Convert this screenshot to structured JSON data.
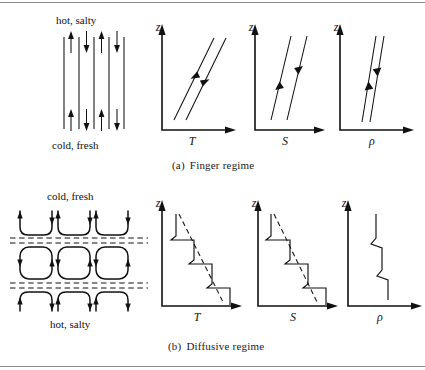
{
  "figure": {
    "title_implicit": "Double-diffusive convection regimes",
    "background": "#ffffff",
    "line_color": "#111111",
    "rule_color": "#8a8a8a",
    "width": 425,
    "height": 370
  },
  "panels": [
    {
      "id": "finger",
      "caption_index": "(a)",
      "caption_text": "Finger regime",
      "schematic": {
        "top_label": "hot, salty",
        "bottom_label": "cold, fresh",
        "finger_count": 4,
        "finger_directions": [
          "up",
          "down",
          "up",
          "down"
        ],
        "description": "vertical salt fingers alternating up and down"
      },
      "charts": [
        {
          "id": "finger-T",
          "type": "line",
          "xlabel": "T",
          "ylabel": "z",
          "grid": false,
          "series": [
            {
              "name": "left-profile",
              "x": [
                0.18,
                0.62
              ],
              "y": [
                0.12,
                0.92
              ],
              "arrow": "up"
            },
            {
              "name": "right-profile",
              "x": [
                0.38,
                0.82
              ],
              "y": [
                0.12,
                0.92
              ],
              "arrow": "down"
            }
          ],
          "xlim": [
            0,
            1
          ],
          "ylim": [
            0,
            1
          ]
        },
        {
          "id": "finger-S",
          "type": "line",
          "xlabel": "S",
          "ylabel": "z",
          "grid": false,
          "series": [
            {
              "name": "left-profile",
              "x": [
                0.3,
                0.58
              ],
              "y": [
                0.12,
                0.92
              ],
              "arrow": "up"
            },
            {
              "name": "right-profile",
              "x": [
                0.52,
                0.8
              ],
              "y": [
                0.12,
                0.92
              ],
              "arrow": "down"
            }
          ],
          "xlim": [
            0,
            1
          ],
          "ylim": [
            0,
            1
          ]
        },
        {
          "id": "finger-rho",
          "type": "line",
          "xlabel": "ρ",
          "ylabel": "z",
          "grid": false,
          "series": [
            {
              "name": "left-profile",
              "x": [
                0.52,
                0.36
              ],
              "y": [
                0.12,
                0.92
              ],
              "arrow": "up"
            },
            {
              "name": "right-profile",
              "x": [
                0.62,
                0.46
              ],
              "y": [
                0.12,
                0.92
              ],
              "arrow": "down"
            }
          ],
          "xlim": [
            0,
            1
          ],
          "ylim": [
            0,
            1
          ]
        }
      ]
    },
    {
      "id": "diffusive",
      "caption_index": "(b)",
      "caption_text": "Diffusive regime",
      "schematic": {
        "top_label": "cold, fresh",
        "bottom_label": "hot, salty",
        "cell_columns": 3,
        "cell_rows": 3,
        "interface_count": 2,
        "description": "stacked convecting layers separated by diffusive interfaces"
      },
      "charts": [
        {
          "id": "diffusive-T",
          "type": "line",
          "xlabel": "T",
          "ylabel": "z",
          "grid": false,
          "series": [
            {
              "name": "staircase",
              "x": [
                0.24,
                0.24,
                0.18,
                0.46,
                0.46,
                0.4,
                0.68,
                0.68,
                0.62,
                0.9,
                0.9
              ],
              "y": [
                0.92,
                0.74,
                0.7,
                0.7,
                0.52,
                0.48,
                0.48,
                0.3,
                0.26,
                0.26,
                0.06
              ]
            },
            {
              "name": "mean-gradient",
              "dashed": true,
              "x": [
                0.26,
                0.86
              ],
              "y": [
                0.92,
                0.04
              ]
            }
          ],
          "xlim": [
            0,
            1
          ],
          "ylim": [
            0,
            1
          ]
        },
        {
          "id": "diffusive-S",
          "type": "line",
          "xlabel": "S",
          "ylabel": "z",
          "grid": false,
          "series": [
            {
              "name": "staircase",
              "x": [
                0.22,
                0.22,
                0.16,
                0.46,
                0.46,
                0.4,
                0.68,
                0.68,
                0.62,
                0.9,
                0.9
              ],
              "y": [
                0.92,
                0.74,
                0.7,
                0.7,
                0.52,
                0.48,
                0.48,
                0.3,
                0.26,
                0.26,
                0.06
              ]
            },
            {
              "name": "mean-gradient",
              "dashed": true,
              "x": [
                0.26,
                0.84
              ],
              "y": [
                0.92,
                0.04
              ]
            }
          ],
          "xlim": [
            0,
            1
          ],
          "ylim": [
            0,
            1
          ]
        },
        {
          "id": "diffusive-rho",
          "type": "line",
          "xlabel": "ρ",
          "ylabel": "z",
          "grid": false,
          "series": [
            {
              "name": "staircase",
              "x": [
                0.44,
                0.44,
                0.38,
                0.52,
                0.52,
                0.46,
                0.6,
                0.6
              ],
              "y": [
                0.92,
                0.72,
                0.66,
                0.62,
                0.4,
                0.34,
                0.3,
                0.06
              ]
            }
          ],
          "xlim": [
            0,
            1
          ],
          "ylim": [
            0,
            1
          ]
        }
      ]
    }
  ]
}
